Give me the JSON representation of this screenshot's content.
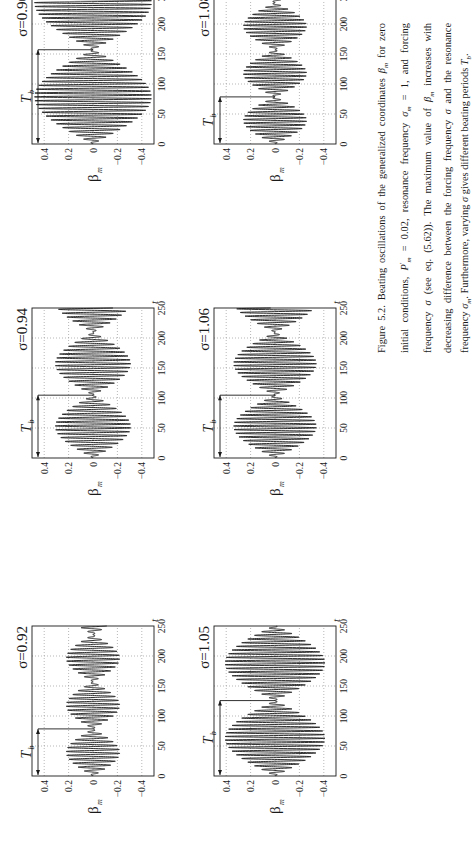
{
  "figure": {
    "label": "Figure 5.2.",
    "caption_parts": [
      "Beating oscillations of the generalized coordinates ",
      "β",
      "m",
      " for zero initial conditions, ",
      "P",
      "m",
      " = 0.02, resonance frequency ",
      "σ",
      "m",
      " = 1, and forcing frequency ",
      "σ",
      " (see eq. (5.62)). The maximum value of ",
      "β",
      "m",
      " increases with decreasing difference between the forcing frequency ",
      "σ",
      " and the resonance frequency ",
      "σ",
      "m",
      ". Furthermore, varying ",
      "σ",
      " gives different beating periods ",
      "T",
      "b",
      "."
    ],
    "caption_text": "Figure 5.2. Beating oscillations of the generalized coordinates βm for zero initial conditions, P'm = 0.02, resonance frequency σm = 1, and forcing frequency σ (see eq. (5.62)). The maximum value of βm increases with decreasing difference between the forcing frequency σ and the resonance frequency σm. Furthermore, varying σ gives different beating periods Tb."
  },
  "axes_common": {
    "x_label": "t",
    "y_label": "β",
    "y_label_sub": "m",
    "x_ticks": [
      "0",
      "50",
      "100",
      "150",
      "200",
      "250"
    ],
    "y_ticks": [
      "0.4",
      "0.2",
      "0",
      "−0.2",
      "−0.4"
    ],
    "xlim": [
      0,
      250
    ],
    "ylim": [
      -0.5,
      0.5
    ],
    "tb_label": "T",
    "tb_sub": "b",
    "grid": "dotted"
  },
  "chart_data": [
    {
      "type": "line",
      "title": "σ=0.92",
      "sigma": 0.92,
      "Pm": 0.02,
      "sigma_m": 1,
      "xlabel": "t",
      "ylabel": "βm",
      "xlim": [
        0,
        250
      ],
      "ylim": [
        -0.5,
        0.5
      ],
      "amplitude_max": 0.22,
      "beating_period_Tb": 78.5,
      "grid": true
    },
    {
      "type": "line",
      "title": "σ=0.94",
      "sigma": 0.94,
      "Pm": 0.02,
      "sigma_m": 1,
      "xlabel": "t",
      "ylabel": "βm",
      "xlim": [
        0,
        250
      ],
      "ylim": [
        -0.5,
        0.5
      ],
      "amplitude_max": 0.31,
      "beating_period_Tb": 104.7,
      "grid": true
    },
    {
      "type": "line",
      "title": "σ=0.96",
      "sigma": 0.96,
      "Pm": 0.02,
      "sigma_m": 1,
      "xlabel": "t",
      "ylabel": "βm",
      "xlim": [
        0,
        250
      ],
      "ylim": [
        -0.5,
        0.5
      ],
      "amplitude_max": 0.48,
      "beating_period_Tb": 157.1,
      "grid": true
    },
    {
      "type": "line",
      "title": "σ=1.05",
      "sigma": 1.05,
      "Pm": 0.02,
      "sigma_m": 1,
      "xlabel": "t",
      "ylabel": "βm",
      "xlim": [
        0,
        250
      ],
      "ylim": [
        -0.5,
        0.5
      ],
      "amplitude_max": 0.41,
      "beating_period_Tb": 125.7,
      "grid": true
    },
    {
      "type": "line",
      "title": "σ=1.06",
      "sigma": 1.06,
      "Pm": 0.02,
      "sigma_m": 1,
      "xlabel": "t",
      "ylabel": "βm",
      "xlim": [
        0,
        250
      ],
      "ylim": [
        -0.5,
        0.5
      ],
      "amplitude_max": 0.34,
      "beating_period_Tb": 104.7,
      "grid": true
    },
    {
      "type": "line",
      "title": "σ=1.08",
      "sigma": 1.08,
      "Pm": 0.02,
      "sigma_m": 1,
      "xlabel": "t",
      "ylabel": "βm",
      "xlim": [
        0,
        250
      ],
      "ylim": [
        -0.5,
        0.5
      ],
      "amplitude_max": 0.26,
      "beating_period_Tb": 78.5,
      "grid": true
    }
  ],
  "panels": [
    {
      "id": "p092",
      "sigma_label": "σ=0.92",
      "col": 0,
      "row": 0
    },
    {
      "id": "p094",
      "sigma_label": "σ=0.94",
      "col": 1,
      "row": 0
    },
    {
      "id": "p096",
      "sigma_label": "σ=0.96",
      "col": 2,
      "row": 0
    },
    {
      "id": "p105",
      "sigma_label": "σ=1.05",
      "col": 0,
      "row": 1
    },
    {
      "id": "p106",
      "sigma_label": "σ=1.06",
      "col": 1,
      "row": 1
    },
    {
      "id": "p108",
      "sigma_label": "σ=1.08",
      "col": 2,
      "row": 1
    }
  ],
  "colors": {
    "ink": "#1a1a1a",
    "grid": "#9a9a9a",
    "background": "#ffffff"
  }
}
